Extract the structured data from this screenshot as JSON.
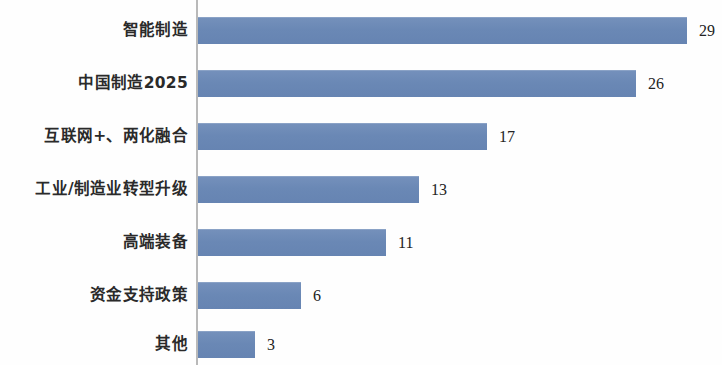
{
  "chart_data": {
    "type": "bar",
    "orientation": "horizontal",
    "title": "",
    "subtitle": "",
    "xlabel": "",
    "ylabel": "",
    "grid": false,
    "legend": null,
    "axis_line": "vertical category axis at left of bars",
    "xlim": [
      0,
      29
    ],
    "categories": [
      "智能制造",
      "中国制造2025",
      "互联网+、两化融合",
      "工业/制造业转型升级",
      "高端装备",
      "资金支持政策",
      "其他"
    ],
    "values": [
      29,
      26,
      17,
      13,
      11,
      6,
      3
    ],
    "value_labels": [
      "29",
      "26",
      "17",
      "13",
      "11",
      "6",
      "3"
    ],
    "bar_color": "#6d8cb8",
    "label_color": "#232323",
    "background": "#ffffff"
  },
  "bars": [
    {
      "label": "智能制造",
      "value": 29,
      "value_label": "29",
      "top": 17,
      "width": 489
    },
    {
      "label": "中国制造2025",
      "value": 26,
      "value_label": "26",
      "top": 70,
      "width": 438
    },
    {
      "label": "互联网+、两化融合",
      "value": 17,
      "value_label": "17",
      "top": 123,
      "width": 289
    },
    {
      "label": "工业/制造业转型升级",
      "value": 13,
      "value_label": "13",
      "top": 176,
      "width": 221
    },
    {
      "label": "高端装备",
      "value": 11,
      "value_label": "11",
      "top": 229,
      "width": 188
    },
    {
      "label": "资金支持政策",
      "value": 6,
      "value_label": "6",
      "top": 282,
      "width": 103
    },
    {
      "label": "其他",
      "value": 3,
      "value_label": "3",
      "top": 331,
      "width": 57
    }
  ]
}
